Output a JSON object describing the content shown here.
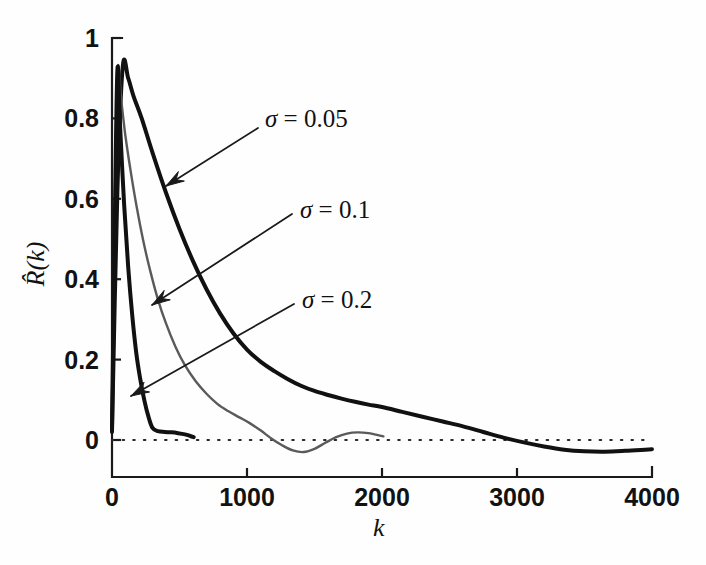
{
  "chart_data": {
    "type": "line",
    "title": "",
    "xlabel": "k",
    "ylabel": "R̂(k)",
    "xlim": [
      0,
      4000
    ],
    "ylim": [
      -0.08,
      1.0
    ],
    "grid": false,
    "legend_position": "inline-annotations",
    "zero_reference_line": true,
    "xticks": [
      0,
      1000,
      2000,
      3000,
      4000
    ],
    "xtick_labels": [
      "0",
      "1000",
      "2000",
      "3000",
      "4000"
    ],
    "yticks": [
      0,
      0.2,
      0.4,
      0.6,
      0.8,
      1
    ],
    "ytick_labels": [
      "0",
      "0.2",
      "0.4",
      "0.6",
      "0.8",
      "1"
    ],
    "annotations": [
      {
        "text": "σ = 0.05",
        "series": "sigma_0.05",
        "x": 0.05
      },
      {
        "text": "σ = 0.1",
        "series": "sigma_0.1",
        "x": 0.1
      },
      {
        "text": "σ = 0.2",
        "series": "sigma_0.2",
        "x": 0.2
      }
    ],
    "series": [
      {
        "name": "sigma_0.05",
        "label": "σ = 0.05",
        "color": "#111111",
        "width": 4,
        "x": [
          0,
          40,
          80,
          120,
          160,
          220,
          300,
          400,
          500,
          600,
          700,
          800,
          900,
          1000,
          1100,
          1200,
          1300,
          1400,
          1500,
          1600,
          1700,
          1800,
          1900,
          2000,
          2150,
          2300,
          2450,
          2600,
          2750,
          2900,
          3050,
          3200,
          3350,
          3500,
          3650,
          3800,
          3950,
          4000
        ],
        "y": [
          0.02,
          0.62,
          0.93,
          0.9,
          0.855,
          0.8,
          0.715,
          0.615,
          0.525,
          0.445,
          0.375,
          0.315,
          0.265,
          0.225,
          0.195,
          0.172,
          0.152,
          0.135,
          0.122,
          0.112,
          0.103,
          0.095,
          0.088,
          0.082,
          0.07,
          0.058,
          0.046,
          0.034,
          0.02,
          0.006,
          -0.006,
          -0.016,
          -0.024,
          -0.028,
          -0.029,
          -0.027,
          -0.024,
          -0.023
        ]
      },
      {
        "name": "sigma_0.1",
        "label": "σ = 0.1",
        "color": "#5a5a5a",
        "width": 2.4,
        "x": [
          0,
          20,
          40,
          70,
          100,
          140,
          180,
          230,
          280,
          340,
          400,
          470,
          540,
          620,
          700,
          780,
          860,
          940,
          1020,
          1100,
          1180,
          1260,
          1340,
          1420,
          1500,
          1580,
          1660,
          1740,
          1820,
          1900,
          1970,
          2010
        ],
        "y": [
          0.03,
          0.55,
          0.92,
          0.84,
          0.755,
          0.665,
          0.585,
          0.498,
          0.425,
          0.35,
          0.29,
          0.232,
          0.186,
          0.146,
          0.115,
          0.09,
          0.072,
          0.057,
          0.042,
          0.024,
          0.004,
          -0.013,
          -0.026,
          -0.03,
          -0.022,
          -0.007,
          0.007,
          0.016,
          0.019,
          0.017,
          0.012,
          0.009
        ]
      },
      {
        "name": "sigma_0.2",
        "label": "σ = 0.2",
        "color": "#111111",
        "width": 4,
        "x": [
          0,
          20,
          40,
          60,
          90,
          120,
          150,
          180,
          210,
          240,
          270,
          300,
          340,
          390,
          440,
          490,
          540,
          580,
          605
        ],
        "y": [
          0.03,
          0.52,
          0.92,
          0.78,
          0.585,
          0.43,
          0.31,
          0.216,
          0.15,
          0.098,
          0.058,
          0.03,
          0.022,
          0.02,
          0.019,
          0.017,
          0.014,
          0.01,
          0.007
        ]
      }
    ]
  },
  "axes": {
    "y_label_text": "R̂(k)",
    "x_label_text": "k"
  },
  "colors": {
    "line_dark": "#111111",
    "line_gray": "#5a5a5a",
    "axis": "#1a1a1a",
    "background": "#fefefe"
  }
}
